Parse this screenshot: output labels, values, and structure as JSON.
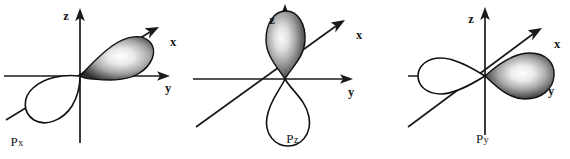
{
  "figure": {
    "background_color": "#ffffff",
    "ink_color": "#141414",
    "lobe_fill_light": "#f2f2f2",
    "lobe_fill_dark": "#3a3a3a",
    "orbitals": [
      {
        "id": "px",
        "caption_main": "P",
        "caption_sub": "x",
        "caption_full": "Px",
        "filled_lobe_axis": "x",
        "filled_lobe_direction": "upper-right (toward viewer)",
        "empty_lobe_direction": "lower-left (away from viewer)",
        "axes": [
          {
            "name": "z",
            "label": "z",
            "direction": "up",
            "label_side": "left-of-arrow"
          },
          {
            "name": "y",
            "label": "y",
            "direction": "right",
            "label_side": "below-arrow"
          },
          {
            "name": "x",
            "label": "x",
            "direction": "upper-right",
            "label_side": "right-of-arrow"
          }
        ]
      },
      {
        "id": "pz",
        "caption_main": "P",
        "caption_sub": "z",
        "caption_full": "Pz",
        "filled_lobe_axis": "z",
        "filled_lobe_direction": "up",
        "empty_lobe_direction": "down",
        "axes": [
          {
            "name": "z",
            "label": "z",
            "direction": "up",
            "label_side": "left-of-arrow"
          },
          {
            "name": "y",
            "label": "y",
            "direction": "right",
            "label_side": "below-arrow"
          },
          {
            "name": "x",
            "label": "x",
            "direction": "upper-right",
            "label_side": "right-of-arrow"
          }
        ]
      },
      {
        "id": "py",
        "caption_main": "P",
        "caption_sub": "y",
        "caption_full": "Py",
        "filled_lobe_axis": "y",
        "filled_lobe_direction": "right",
        "empty_lobe_direction": "left",
        "axes": [
          {
            "name": "z",
            "label": "z",
            "direction": "up",
            "label_side": "left-of-arrow"
          },
          {
            "name": "y",
            "label": "y",
            "direction": "right",
            "label_side": "below-arrow"
          },
          {
            "name": "x",
            "label": "x",
            "direction": "upper-right",
            "label_side": "right-of-arrow"
          }
        ]
      }
    ]
  }
}
